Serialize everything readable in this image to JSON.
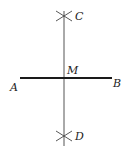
{
  "diagram": {
    "type": "perpendicular-bisector-construction",
    "points": {
      "A": {
        "label": "A"
      },
      "B": {
        "label": "B"
      },
      "C": {
        "label": "C"
      },
      "D": {
        "label": "D"
      },
      "M": {
        "label": "M"
      }
    },
    "segments": [
      {
        "name": "AB",
        "style": "thick"
      },
      {
        "name": "CD",
        "style": "thin"
      }
    ],
    "arc_marks": [
      "C",
      "D"
    ],
    "colors": {
      "line": "#1a1a1a",
      "thin_line": "#555555",
      "background": "#ffffff"
    }
  }
}
